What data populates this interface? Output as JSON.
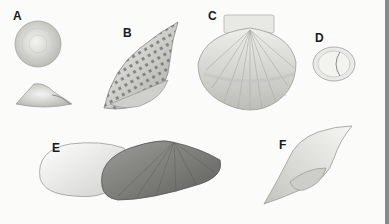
{
  "figure": {
    "labels": [
      {
        "id": "A",
        "text": "A",
        "x": 13,
        "y": 9
      },
      {
        "id": "B",
        "text": "B",
        "x": 123,
        "y": 26
      },
      {
        "id": "C",
        "text": "C",
        "x": 208,
        "y": 9
      },
      {
        "id": "D",
        "text": "D",
        "x": 315,
        "y": 31
      },
      {
        "id": "E",
        "text": "E",
        "x": 52,
        "y": 141
      },
      {
        "id": "F",
        "text": "F",
        "x": 279,
        "y": 138
      }
    ],
    "colors": {
      "background": "#fbfbfa",
      "shell_light": "#e6e6e3",
      "shell_mid": "#bdbdb8",
      "shell_dark": "#7a7a76",
      "spots": "#6f6f6c",
      "edge_bar": "#8a8a8a"
    }
  }
}
